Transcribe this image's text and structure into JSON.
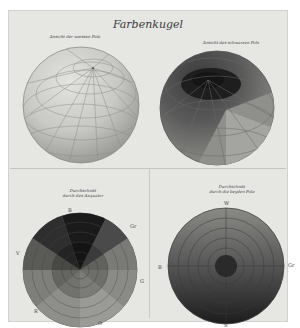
{
  "plate": {
    "title": "Farbenkugel",
    "figures": [
      {
        "id": "top-left",
        "caption": "Ansicht der weissen Pole",
        "kind": "sphere",
        "tone": "light"
      },
      {
        "id": "top-right",
        "caption": "Ansicht des schwarzen Pols",
        "kind": "sphere",
        "tone": "dark"
      },
      {
        "id": "bottom-left",
        "caption_line1": "Durchschnitt",
        "caption_line2": "durch den Aequator",
        "kind": "disc-sectors",
        "labels": {
          "top": "B",
          "upper_right": "Gr",
          "left": "V",
          "right": "G",
          "lower_left": "R",
          "bottom": "O"
        }
      },
      {
        "id": "bottom-right",
        "caption_line1": "Durchschnitt",
        "caption_line2": "durch die beyden Pole",
        "kind": "disc-rings",
        "labels": {
          "top": "W",
          "left": "B",
          "right": "Gr",
          "bottom": "S"
        }
      }
    ]
  },
  "colors": {
    "paper": "#e6e6e3",
    "ink": "#3a3a3a",
    "light_sphere": "#c4c4c0",
    "dark": "#2a2a2a"
  }
}
